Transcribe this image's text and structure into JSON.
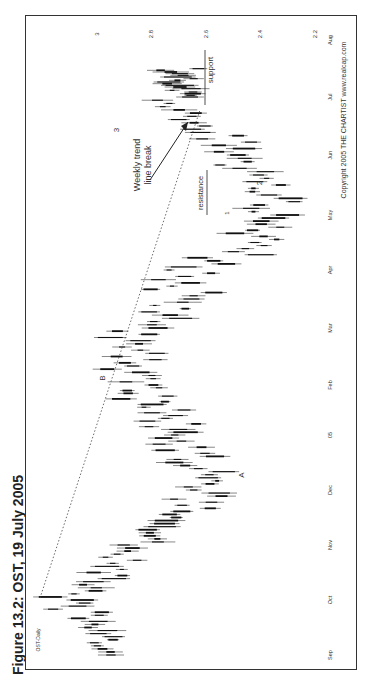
{
  "figure": {
    "title": "Figure 13.2: OST, 19 July 2005"
  },
  "chart_data": {
    "type": "bar",
    "subtype": "ohlc-price-bars",
    "orientation": "rotated 90° counter-clockwise",
    "title": "OST-Daily",
    "series_label": "OST-Daily",
    "xlabel": "",
    "ylabel": "",
    "x_ticks": [
      "Sep",
      "Oct",
      "Nov",
      "Dec",
      "05",
      "Feb",
      "Mar",
      "Apr",
      "May",
      "Jun",
      "Jul",
      "Aug"
    ],
    "y_ticks": [
      "2.2",
      "2.4",
      "2.6",
      "2.8",
      "3"
    ],
    "ylim": [
      2.15,
      3.3
    ],
    "grid": false,
    "monthly_range": [
      {
        "month": "Sep",
        "low": 2.88,
        "high": 3.02
      },
      {
        "month": "Oct",
        "low": 3.0,
        "high": 3.2
      },
      {
        "month": "Nov",
        "low": 2.78,
        "high": 2.95
      },
      {
        "month": "Dec",
        "low": 2.47,
        "high": 2.68
      },
      {
        "month": "05",
        "low": 2.58,
        "high": 2.8
      },
      {
        "month": "Feb",
        "low": 2.78,
        "high": 3.0
      },
      {
        "month": "Mar",
        "low": 2.74,
        "high": 2.95
      },
      {
        "month": "Apr",
        "low": 2.45,
        "high": 2.75
      },
      {
        "month": "May",
        "low": 2.22,
        "high": 2.42
      },
      {
        "month": "Jun",
        "low": 2.38,
        "high": 2.58
      },
      {
        "month": "Jul",
        "low": 2.6,
        "high": 2.8
      }
    ],
    "trendline": {
      "style": "dotted",
      "from": {
        "month": "Oct",
        "price": 3.2
      },
      "to": {
        "month": "Jul",
        "price": 2.6
      },
      "label": "B"
    },
    "levels": [
      {
        "name": "support",
        "price": 2.6,
        "from": "Jul",
        "to": "Aug"
      },
      {
        "name": "resistance",
        "price": 2.6,
        "from": "May",
        "to": "Jun"
      }
    ],
    "annotations": [
      {
        "text": "A",
        "month": "Dec",
        "price": 2.45
      },
      {
        "text": "B",
        "month": "Feb",
        "price": 3.05
      },
      {
        "text": "1",
        "month": "May",
        "price": 2.45
      },
      {
        "text": "2",
        "month": "Jun",
        "price": 2.35
      },
      {
        "text": "3",
        "month": "Jul",
        "price": 2.85
      },
      {
        "text": "Weekly trend line break",
        "arrow": true,
        "month": "Jul",
        "price": 2.75
      },
      {
        "text": "support"
      },
      {
        "text": "resistance"
      }
    ],
    "copyright": "Copyright 2005  THE CHARTIST  www.realcap.com"
  },
  "labels": {
    "series": "OST-Daily",
    "weekly_1": "Weekly trend",
    "weekly_2": "line break",
    "support": "support",
    "resistance": "resistance",
    "A": "A",
    "B": "B",
    "n1": "1",
    "n2": "2",
    "n3": "3",
    "copyright": "Copyright 2005  THE CHARTIST  www.realcap.com"
  }
}
